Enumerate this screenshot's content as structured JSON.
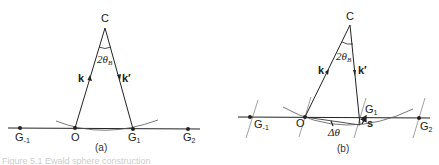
{
  "figure": {
    "panel_a": {
      "caption": "(a)",
      "center_label": "C",
      "angle_label": "2θ",
      "angle_sub": "B",
      "k_label": "k",
      "kprime_label": "k′",
      "points": {
        "g_minus1": {
          "label": "G",
          "sub": "-1"
        },
        "origin": {
          "label": "O"
        },
        "g1": {
          "label": "G",
          "sub": "1"
        },
        "g2": {
          "label": "G",
          "sub": "2"
        }
      }
    },
    "panel_b": {
      "caption": "(b)",
      "center_label": "C",
      "angle_label": "2θ",
      "angle_sub": "B",
      "k_label": "k",
      "kprime_label": "k′",
      "delta_label": "Δθ",
      "s_label": "s",
      "points": {
        "g_minus1": {
          "label": "G",
          "sub": "-1"
        },
        "origin": {
          "label": "O"
        },
        "g1": {
          "label": "G",
          "sub": "1"
        },
        "g2": {
          "label": "G",
          "sub": "2"
        }
      }
    },
    "caption_fragment": "Figure 5.1  Ewald sphere construction"
  }
}
